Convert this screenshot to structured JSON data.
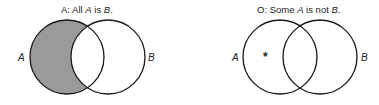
{
  "diagrams": [
    {
      "id": "A",
      "title": {
        "prefix": "A:  All ",
        "term1": "A",
        "mid": " is ",
        "term2": "B",
        "suffix": "."
      },
      "left_label": "A",
      "right_label": "B",
      "shaded_region": "A-only",
      "shade_color": "#9a9a9a"
    },
    {
      "id": "O",
      "title": {
        "prefix": "O:  Some ",
        "term1": "A",
        "mid": " is not ",
        "term2": "B",
        "suffix": "."
      },
      "left_label": "A",
      "right_label": "B",
      "marker": "*",
      "marker_region": "A-only"
    }
  ]
}
